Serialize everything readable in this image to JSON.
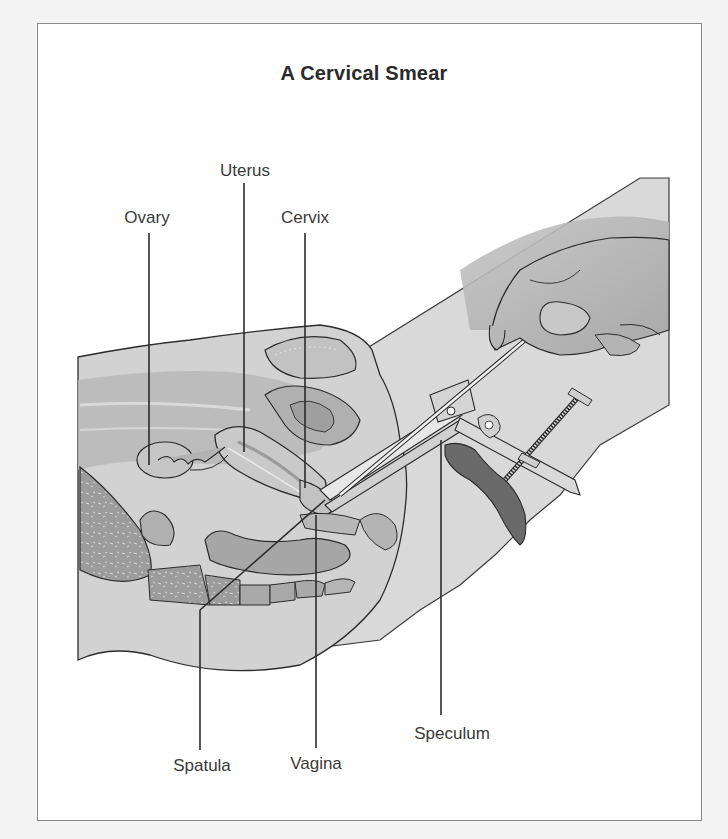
{
  "diagram": {
    "title": "A Cervical Smear",
    "labels": {
      "ovary": "Ovary",
      "uterus": "Uterus",
      "cervix": "Cervix",
      "spatula": "Spatula",
      "vagina": "Vagina",
      "speculum": "Speculum"
    },
    "colors": {
      "background": "#f4f4f4",
      "frame_fill": "#ffffff",
      "frame_border": "#8a8a8a",
      "outline": "#2b2b2b",
      "tissue_light": "#d6d6d6",
      "tissue_mid": "#bdbdbd",
      "tissue_dark": "#9e9e9e",
      "speculum_blade_dark": "#6a6a6a"
    }
  }
}
